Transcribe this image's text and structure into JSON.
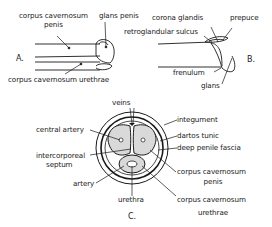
{
  "diagram": {
    "colors": {
      "ink": "#1a1a1a",
      "background": "#ffffff",
      "tissue": "#d9d9d9"
    },
    "panelA": {
      "part_label": "A.",
      "labels": {
        "cc_penis_line1": "corpus cavernosum",
        "cc_penis_line2": "penis",
        "glans_penis": "glans penis",
        "cc_urethrae": "corpus cavernosum urethrae"
      }
    },
    "panelB": {
      "part_label": "B.",
      "labels": {
        "corona_glandis": "corona glandis",
        "prepuce": "prepuce",
        "retroglandular_sulcus": "retroglandular sulcus",
        "frenulum": "frenulum",
        "glans": "glans"
      }
    },
    "panelC": {
      "part_label": "C.",
      "labels": {
        "veins": "veins",
        "central_artery": "central artery",
        "intercorporeal_line1": "intercorporeal",
        "intercorporeal_line2": "septum",
        "artery": "artery",
        "urethra": "urethra",
        "integument": "integument",
        "dartos_tunic": "dartos tunic",
        "deep_penile_fascia": "deep penile fascia",
        "cc_penis_line1": "corpus cavernosum",
        "cc_penis_line2": "penis",
        "cc_urethrae_line1": "corpus cavernosum",
        "cc_urethrae_line2": "urethrae"
      }
    }
  }
}
